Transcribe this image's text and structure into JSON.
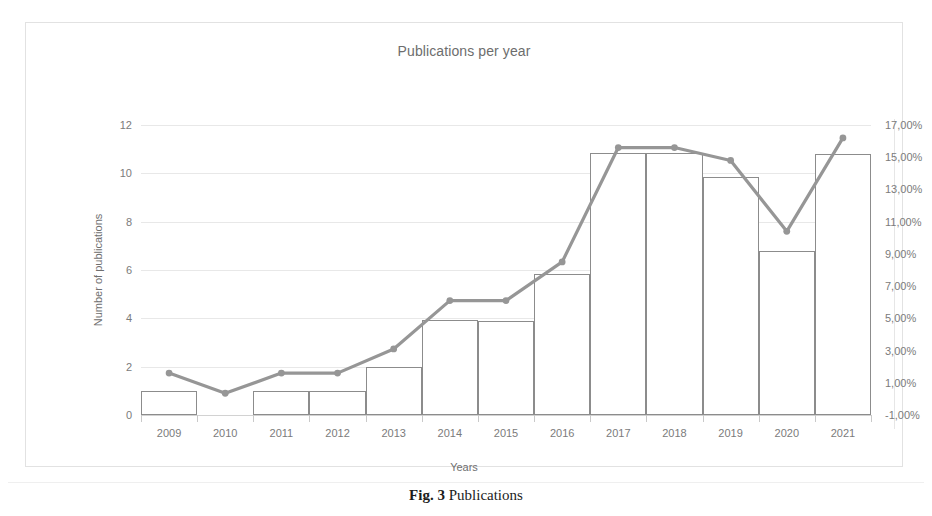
{
  "figure": {
    "caption_label": "Fig. 3",
    "caption_text": "Publications"
  },
  "chart_data": {
    "type": "bar",
    "title": "Publications per year",
    "xlabel": "Years",
    "ylabel": "Number of publications",
    "y2label": "",
    "grid": true,
    "legend": "none",
    "categories": [
      "2009",
      "2010",
      "2011",
      "2012",
      "2013",
      "2014",
      "2015",
      "2016",
      "2017",
      "2018",
      "2019",
      "2020",
      "2021"
    ],
    "ylim": [
      0,
      12
    ],
    "yticks": [
      0,
      2,
      4,
      6,
      8,
      10,
      12
    ],
    "ytick_labels": [
      "0",
      "2",
      "4",
      "6",
      "8",
      "10",
      "12"
    ],
    "y2lim": [
      -1,
      17
    ],
    "y2ticks": [
      -1,
      1,
      3,
      5,
      7,
      9,
      11,
      13,
      15,
      17
    ],
    "y2tick_labels": [
      "-1,00%",
      "1,00%",
      "3,00%",
      "5,00%",
      "7,00%",
      "9,00%",
      "11,00%",
      "13,00%",
      "15,00%",
      "17,00%"
    ],
    "series": [
      {
        "name": "Number of publications",
        "type": "bar",
        "axis": "left",
        "color": "#8c8c8c",
        "fill": "#ffffff",
        "values": [
          1,
          0,
          1,
          1,
          2,
          3.95,
          3.9,
          5.85,
          10.85,
          10.85,
          9.85,
          6.8,
          10.8
        ]
      },
      {
        "name": "Percentage of publications",
        "type": "line",
        "axis": "right",
        "color": "#969696",
        "values": [
          1.6,
          0.35,
          1.6,
          1.6,
          3.1,
          6.1,
          6.1,
          8.5,
          15.6,
          15.6,
          14.8,
          10.4,
          16.2
        ]
      }
    ]
  }
}
